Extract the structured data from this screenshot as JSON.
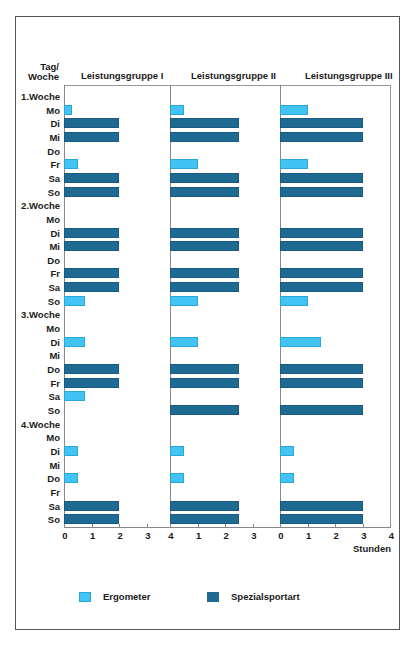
{
  "chart_data": {
    "type": "bar",
    "orientation": "horizontal",
    "title": "",
    "ylabel": "Tag/ Woche",
    "xlabel": "Stunden",
    "panels": [
      "Leistungsgruppe I",
      "Leistungsgruppe II",
      "Leistungsgruppe III"
    ],
    "xlim": [
      0,
      4
    ],
    "xticks": [
      0,
      1,
      2,
      3,
      4
    ],
    "xtick_labels": [
      [
        "0",
        "1",
        "2",
        "3"
      ],
      [
        "4",
        "1",
        "2",
        "3"
      ],
      [
        "0",
        "1",
        "2",
        "3",
        "4"
      ]
    ],
    "legend": [
      {
        "key": "e",
        "label": "Ergometer",
        "color": "#41c3f3"
      },
      {
        "key": "s",
        "label": "Spezialsportart",
        "color": "#1f6a93"
      }
    ],
    "rows": [
      {
        "label": "1.Woche",
        "header": true
      },
      {
        "label": "Mo",
        "I": [
          "e",
          0.3
        ],
        "II": [
          "e",
          0.5
        ],
        "III": [
          "e",
          1.0
        ]
      },
      {
        "label": "Di",
        "I": [
          "s",
          2.0
        ],
        "II": [
          "s",
          2.5
        ],
        "III": [
          "s",
          3.0
        ]
      },
      {
        "label": "Mi",
        "I": [
          "s",
          2.0
        ],
        "II": [
          "s",
          2.5
        ],
        "III": [
          "s",
          3.0
        ]
      },
      {
        "label": "Do"
      },
      {
        "label": "Fr",
        "I": [
          "e",
          0.5
        ],
        "II": [
          "e",
          1.0
        ],
        "III": [
          "e",
          1.0
        ]
      },
      {
        "label": "Sa",
        "I": [
          "s",
          2.0
        ],
        "II": [
          "s",
          2.5
        ],
        "III": [
          "s",
          3.0
        ]
      },
      {
        "label": "So",
        "I": [
          "s",
          2.0
        ],
        "II": [
          "s",
          2.5
        ],
        "III": [
          "s",
          3.0
        ]
      },
      {
        "label": "2.Woche",
        "header": true
      },
      {
        "label": "Mo"
      },
      {
        "label": "Di",
        "I": [
          "s",
          2.0
        ],
        "II": [
          "s",
          2.5
        ],
        "III": [
          "s",
          3.0
        ]
      },
      {
        "label": "Mi",
        "I": [
          "s",
          2.0
        ],
        "II": [
          "s",
          2.5
        ],
        "III": [
          "s",
          3.0
        ]
      },
      {
        "label": "Do"
      },
      {
        "label": "Fr",
        "I": [
          "s",
          2.0
        ],
        "II": [
          "s",
          2.5
        ],
        "III": [
          "s",
          3.0
        ]
      },
      {
        "label": "Sa",
        "I": [
          "s",
          2.0
        ],
        "II": [
          "s",
          2.5
        ],
        "III": [
          "s",
          3.0
        ]
      },
      {
        "label": "So",
        "I": [
          "e",
          0.75
        ],
        "II": [
          "e",
          1.0
        ],
        "III": [
          "e",
          1.0
        ]
      },
      {
        "label": "3.Woche",
        "header": true
      },
      {
        "label": "Mo"
      },
      {
        "label": "Di",
        "I": [
          "e",
          0.75
        ],
        "II": [
          "e",
          1.0
        ],
        "III": [
          "e",
          1.5
        ]
      },
      {
        "label": "Mi"
      },
      {
        "label": "Do",
        "I": [
          "s",
          2.0
        ],
        "II": [
          "s",
          2.5
        ],
        "III": [
          "s",
          3.0
        ]
      },
      {
        "label": "Fr",
        "I": [
          "s",
          2.0
        ],
        "II": [
          "s",
          2.5
        ],
        "III": [
          "s",
          3.0
        ]
      },
      {
        "label": "Sa",
        "I": [
          "e",
          0.75
        ]
      },
      {
        "label": "So",
        "II": [
          "s",
          2.5
        ],
        "III": [
          "s",
          3.0
        ]
      },
      {
        "label": "4.Woche",
        "header": true
      },
      {
        "label": "Mo"
      },
      {
        "label": "Di",
        "I": [
          "e",
          0.5
        ],
        "II": [
          "e",
          0.5
        ],
        "III": [
          "e",
          0.5
        ]
      },
      {
        "label": "Mi"
      },
      {
        "label": "Do",
        "I": [
          "e",
          0.5
        ],
        "II": [
          "e",
          0.5
        ],
        "III": [
          "e",
          0.5
        ]
      },
      {
        "label": "Fr"
      },
      {
        "label": "Sa",
        "I": [
          "s",
          2.0
        ],
        "II": [
          "s",
          2.5
        ],
        "III": [
          "s",
          3.0
        ]
      },
      {
        "label": "So",
        "I": [
          "s",
          2.0
        ],
        "II": [
          "s",
          2.5
        ],
        "III": [
          "s",
          3.0
        ]
      }
    ]
  },
  "labels": {
    "ylabel_line1": "Tag/",
    "ylabel_line2": "Woche",
    "panel_1": "Leistungsgruppe I",
    "panel_2": "Leistungsgruppe II",
    "panel_3": "Leistungsgruppe III",
    "unit": "Stunden",
    "legend_ergometer": "Ergometer",
    "legend_spezial": "Spezialsportart"
  }
}
